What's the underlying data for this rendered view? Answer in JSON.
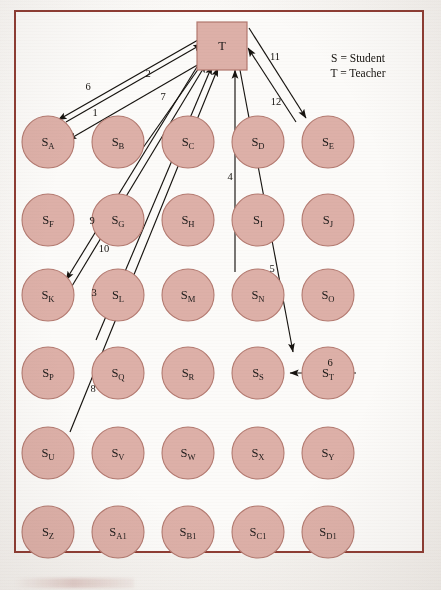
{
  "figure": {
    "frame_color": "#8e3c33",
    "node_fill": "#ddb0a8",
    "node_stroke": "#b3796f",
    "edge_color": "#16130f"
  },
  "legend": {
    "line1": "S = Student",
    "line2": "T = Teacher"
  },
  "teacher": {
    "label": "T",
    "x": 222,
    "y": 46,
    "width": 50,
    "height": 48
  },
  "grid": {
    "columns": 5,
    "rows": 6,
    "col_x": [
      48,
      118,
      188,
      258,
      328
    ],
    "row_y": [
      142,
      220,
      295,
      373,
      453,
      532
    ],
    "radius": 26
  },
  "nodes": [
    {
      "id": "SA",
      "base": "S",
      "sub": "A",
      "col": 0,
      "row": 0
    },
    {
      "id": "SB",
      "base": "S",
      "sub": "B",
      "col": 1,
      "row": 0
    },
    {
      "id": "SC",
      "base": "S",
      "sub": "C",
      "col": 2,
      "row": 0
    },
    {
      "id": "SD",
      "base": "S",
      "sub": "D",
      "col": 3,
      "row": 0
    },
    {
      "id": "SE",
      "base": "S",
      "sub": "E",
      "col": 4,
      "row": 0
    },
    {
      "id": "SF",
      "base": "S",
      "sub": "F",
      "col": 0,
      "row": 1
    },
    {
      "id": "SG",
      "base": "S",
      "sub": "G",
      "col": 1,
      "row": 1
    },
    {
      "id": "SH",
      "base": "S",
      "sub": "H",
      "col": 2,
      "row": 1
    },
    {
      "id": "SI",
      "base": "S",
      "sub": "I",
      "col": 3,
      "row": 1
    },
    {
      "id": "SJ",
      "base": "S",
      "sub": "J",
      "col": 4,
      "row": 1
    },
    {
      "id": "SK",
      "base": "S",
      "sub": "K",
      "col": 0,
      "row": 2
    },
    {
      "id": "SL",
      "base": "S",
      "sub": "L",
      "col": 1,
      "row": 2
    },
    {
      "id": "SM",
      "base": "S",
      "sub": "M",
      "col": 2,
      "row": 2
    },
    {
      "id": "SN",
      "base": "S",
      "sub": "N",
      "col": 3,
      "row": 2
    },
    {
      "id": "SO",
      "base": "S",
      "sub": "O",
      "col": 4,
      "row": 2
    },
    {
      "id": "SP",
      "base": "S",
      "sub": "P",
      "col": 0,
      "row": 3
    },
    {
      "id": "SQ",
      "base": "S",
      "sub": "Q",
      "col": 1,
      "row": 3
    },
    {
      "id": "SR",
      "base": "S",
      "sub": "R",
      "col": 2,
      "row": 3
    },
    {
      "id": "SS",
      "base": "S",
      "sub": "S",
      "col": 3,
      "row": 3
    },
    {
      "id": "ST",
      "base": "S",
      "sub": "T",
      "col": 4,
      "row": 3
    },
    {
      "id": "SU",
      "base": "S",
      "sub": "U",
      "col": 0,
      "row": 4
    },
    {
      "id": "SV",
      "base": "S",
      "sub": "V",
      "col": 1,
      "row": 4
    },
    {
      "id": "SW",
      "base": "S",
      "sub": "W",
      "col": 2,
      "row": 4
    },
    {
      "id": "SX",
      "base": "S",
      "sub": "X",
      "col": 3,
      "row": 4
    },
    {
      "id": "SY",
      "base": "S",
      "sub": "Y",
      "col": 4,
      "row": 4
    },
    {
      "id": "SZ",
      "base": "S",
      "sub": "Z",
      "col": 0,
      "row": 5
    },
    {
      "id": "SA1",
      "base": "S",
      "sub": "A1",
      "col": 1,
      "row": 5
    },
    {
      "id": "SB1",
      "base": "S",
      "sub": "B1",
      "col": 2,
      "row": 5
    },
    {
      "id": "SC1",
      "base": "S",
      "sub": "C1",
      "col": 3,
      "row": 5
    },
    {
      "id": "SD1",
      "base": "S",
      "sub": "D1",
      "col": 4,
      "row": 5
    }
  ],
  "edges": [
    {
      "label": "6",
      "from": "T",
      "to": "SA",
      "x1": 198,
      "y1": 40,
      "x2": 58,
      "y2": 120,
      "lx": 88,
      "ly": 90
    },
    {
      "label": "2",
      "from": "SA",
      "to": "T",
      "x1": 66,
      "y1": 122,
      "x2": 202,
      "y2": 44,
      "lx": 148,
      "ly": 77
    },
    {
      "label": "1",
      "from": "T",
      "to": "SA",
      "x1": 206,
      "y1": 60,
      "x2": 68,
      "y2": 140,
      "lx": 95,
      "ly": 116
    },
    {
      "label": "7",
      "from": "SB",
      "to": "T",
      "x1": 133,
      "y1": 162,
      "x2": 206,
      "y2": 58,
      "lx": 163,
      "ly": 100
    },
    {
      "label": "9",
      "from": "T",
      "to": "SK",
      "x1": 200,
      "y1": 62,
      "x2": 66,
      "y2": 280,
      "lx": 92,
      "ly": 224
    },
    {
      "label": "10",
      "from": "SG",
      "to": "T",
      "x1": 72,
      "y1": 286,
      "x2": 206,
      "y2": 64,
      "lx": 104,
      "ly": 252
    },
    {
      "label": "3",
      "from": "SL",
      "to": "T",
      "x1": 96,
      "y1": 340,
      "x2": 212,
      "y2": 66,
      "lx": 94,
      "ly": 296
    },
    {
      "label": "8",
      "from": "SU",
      "to": "T",
      "x1": 70,
      "y1": 432,
      "x2": 218,
      "y2": 68,
      "lx": 93,
      "ly": 392
    },
    {
      "label": "4",
      "from": "SM",
      "to": "T",
      "x1": 235,
      "y1": 272,
      "x2": 235,
      "y2": 70,
      "lx": 230,
      "ly": 180
    },
    {
      "label": "5",
      "from": "T",
      "to": "SS",
      "x1": 240,
      "y1": 70,
      "x2": 293,
      "y2": 352,
      "lx": 272,
      "ly": 272
    },
    {
      "label": "11",
      "from": "SD",
      "to": "T",
      "x1": 296,
      "y1": 122,
      "x2": 248,
      "y2": 48,
      "lx": 275,
      "ly": 60
    },
    {
      "label": "12",
      "from": "T",
      "to": "SD",
      "x1": 249,
      "y1": 28,
      "x2": 306,
      "y2": 118,
      "lx": 276,
      "ly": 105
    },
    {
      "label": "6",
      "from": "ST",
      "to": "SS",
      "x1": 356,
      "y1": 373,
      "x2": 290,
      "y2": 373,
      "lx": 330,
      "ly": 366
    }
  ]
}
